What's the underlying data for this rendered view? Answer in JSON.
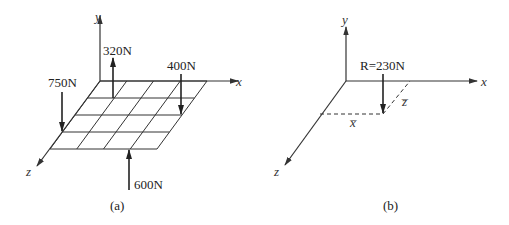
{
  "panels": [
    {
      "id": "a",
      "caption": "(a)",
      "axes": {
        "x": "x",
        "y": "y",
        "z": "z"
      },
      "grid": {
        "rows": 4,
        "cols": 4
      },
      "forces": [
        {
          "label": "320N",
          "direction": "up"
        },
        {
          "label": "400N",
          "direction": "down"
        },
        {
          "label": "750N",
          "direction": "down"
        },
        {
          "label": "600N",
          "direction": "up"
        }
      ]
    },
    {
      "id": "b",
      "caption": "(b)",
      "axes": {
        "x": "x",
        "y": "y",
        "z": "z"
      },
      "resultant": {
        "label": "R=230N",
        "direction": "down"
      },
      "dims": {
        "xbar": "x̅",
        "zbar": "z̅"
      }
    }
  ],
  "colors": {
    "line": "#333333",
    "arrow": "#222222",
    "background": "#ffffff"
  }
}
